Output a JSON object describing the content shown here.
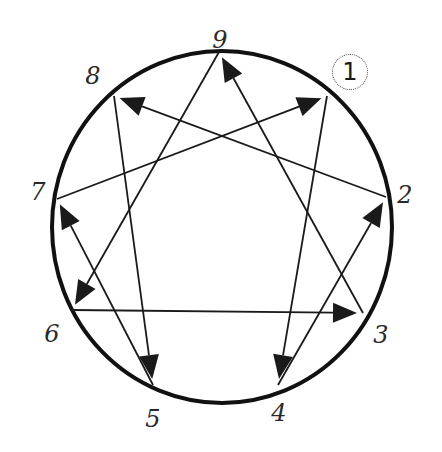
{
  "diagram": {
    "type": "enneagram",
    "circle": {
      "cx": 222,
      "cy": 227,
      "rx": 170,
      "ry": 176,
      "stroke": "#111111",
      "stroke_width": 4
    },
    "line_color": "#1a1a1a",
    "vertices": [
      {
        "id": "9",
        "label": "9",
        "x": 219,
        "y": 52,
        "label_x": 220,
        "label_y": 40
      },
      {
        "id": "1",
        "label": "1",
        "x": 327,
        "y": 96,
        "label_x": 320,
        "label_y": 68
      },
      {
        "id": "2",
        "label": "2",
        "x": 386,
        "y": 197,
        "label_x": 405,
        "label_y": 195
      },
      {
        "id": "3",
        "label": "3",
        "x": 363,
        "y": 313,
        "label_x": 381,
        "label_y": 335
      },
      {
        "id": "4",
        "label": "4",
        "x": 278,
        "y": 385,
        "label_x": 279,
        "label_y": 413
      },
      {
        "id": "5",
        "label": "5",
        "x": 153,
        "y": 385,
        "label_x": 153,
        "label_y": 419
      },
      {
        "id": "6",
        "label": "6",
        "x": 72,
        "y": 310,
        "label_x": 52,
        "label_y": 334
      },
      {
        "id": "7",
        "label": "7",
        "x": 57,
        "y": 199,
        "label_x": 38,
        "label_y": 192
      },
      {
        "id": "8",
        "label": "8",
        "x": 114,
        "y": 96,
        "label_x": 93,
        "label_y": 76
      }
    ],
    "arrows": [
      {
        "from": "1",
        "to": "4"
      },
      {
        "from": "4",
        "to": "2"
      },
      {
        "from": "2",
        "to": "8"
      },
      {
        "from": "8",
        "to": "5"
      },
      {
        "from": "5",
        "to": "7"
      },
      {
        "from": "7",
        "to": "1"
      },
      {
        "from": "9",
        "to": "6"
      },
      {
        "from": "6",
        "to": "3"
      },
      {
        "from": "3",
        "to": "9"
      }
    ],
    "badge": {
      "label": "1",
      "x": 350,
      "y": 72
    }
  }
}
